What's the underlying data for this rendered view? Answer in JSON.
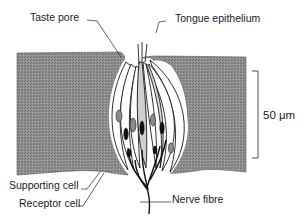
{
  "figure": {
    "labels": {
      "taste_pore": "Taste pore",
      "tongue_epithelium": "Tongue epithelium",
      "supporting_cell": "Supporting cell",
      "receptor_cell": "Receptor cell",
      "nerve_fibre": "Nerve fibre"
    },
    "scale_bar": {
      "label": "50 μm"
    },
    "colors": {
      "epithelium": "#8c8c8c",
      "outline": "#1a1a1a",
      "nucleus": "#8a8a8a",
      "receptor_nucleus": "#111111",
      "background": "#ffffff"
    }
  }
}
